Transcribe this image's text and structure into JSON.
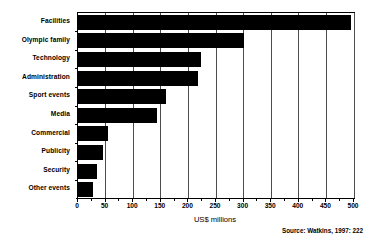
{
  "chart_data": {
    "type": "bar",
    "orientation": "horizontal",
    "title": "",
    "xlabel": "US$ millions",
    "ylabel": "",
    "xlim": [
      0,
      500
    ],
    "xticks": [
      0,
      50,
      100,
      150,
      200,
      250,
      300,
      350,
      400,
      450,
      500
    ],
    "xtick_labels": [
      "0",
      "50",
      "100",
      "150",
      "200",
      "250",
      "300",
      "350",
      "400",
      "450",
      "500"
    ],
    "minor_tick_step": 25,
    "grid": "vertical",
    "legend": "none",
    "bar_color": "#000000",
    "categories": [
      "Facilities",
      "Olympic family",
      "Technology",
      "Administration",
      "Sport events",
      "Media",
      "Commercial",
      "Publicity",
      "Security",
      "Other events"
    ],
    "values": [
      495,
      300,
      222,
      218,
      160,
      143,
      55,
      45,
      35,
      28
    ],
    "annotations": [
      "Source:  Watkins, 1997: 222"
    ]
  },
  "axis": {
    "x_title": "US$ millions"
  },
  "source": {
    "text": "Source:  Watkins, 1997: 222"
  }
}
